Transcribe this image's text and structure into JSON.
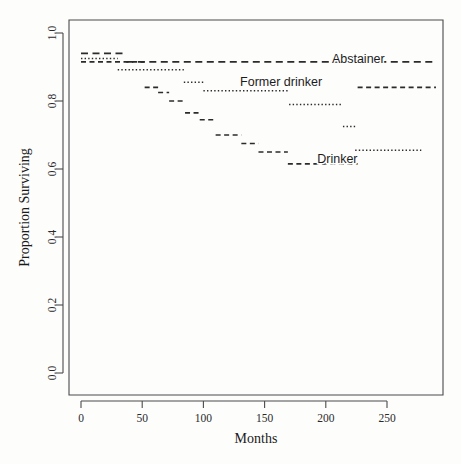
{
  "figure": {
    "background": "#fdfdfc",
    "ink": "#2b2b2b",
    "caption": ""
  },
  "chart_data": {
    "type": "line",
    "subtype": "kaplan-meier-step",
    "title": "",
    "xlabel": "Months",
    "ylabel": "Proportion Surviving",
    "xlim": [
      0,
      290
    ],
    "ylim": [
      0.0,
      1.0
    ],
    "grid": false,
    "legend_position": "inline-annotations",
    "xticks": [
      0,
      50,
      100,
      150,
      200,
      250
    ],
    "xticklabels": [
      "0",
      "50",
      "100",
      "150",
      "200",
      "250"
    ],
    "yticks": [
      0.0,
      0.2,
      0.4,
      0.6,
      0.8,
      1.0
    ],
    "yticklabels": [
      "0.0",
      "0.2",
      "0.4",
      "0.6",
      "0.8",
      "1.0"
    ],
    "series": [
      {
        "name": "Abstainer",
        "linestyle": "longdash",
        "label_x": 205,
        "label_y": 0.925,
        "steps": [
          [
            0,
            0.94
          ],
          [
            37,
            0.94
          ],
          [
            37,
            0.915
          ],
          [
            290,
            0.915
          ]
        ]
      },
      {
        "name": "Former drinker",
        "linestyle": "dotted",
        "label_x": 130,
        "label_y": 0.855,
        "steps": [
          [
            0,
            0.925
          ],
          [
            30,
            0.925
          ],
          [
            30,
            0.892
          ],
          [
            84,
            0.892
          ],
          [
            84,
            0.855
          ],
          [
            100,
            0.855
          ],
          [
            100,
            0.83
          ],
          [
            170,
            0.83
          ],
          [
            170,
            0.79
          ],
          [
            214,
            0.79
          ],
          [
            214,
            0.725
          ],
          [
            224,
            0.725
          ],
          [
            224,
            0.655
          ],
          [
            278,
            0.655
          ]
        ]
      },
      {
        "name": "Drinker",
        "linestyle": "dashed",
        "label_x": 193,
        "label_y": 0.63,
        "steps": [
          [
            0,
            0.915
          ],
          [
            52,
            0.915
          ],
          [
            52,
            0.84
          ],
          [
            63,
            0.84
          ],
          [
            63,
            0.825
          ],
          [
            72,
            0.825
          ],
          [
            72,
            0.8
          ],
          [
            85,
            0.8
          ],
          [
            85,
            0.765
          ],
          [
            97,
            0.765
          ],
          [
            97,
            0.745
          ],
          [
            110,
            0.745
          ],
          [
            110,
            0.7
          ],
          [
            131,
            0.7
          ],
          [
            131,
            0.675
          ],
          [
            145,
            0.675
          ],
          [
            145,
            0.65
          ],
          [
            169,
            0.65
          ],
          [
            169,
            0.615
          ],
          [
            226,
            0.615
          ],
          [
            226,
            0.84
          ],
          [
            290,
            0.84
          ]
        ]
      }
    ],
    "annotations": [
      {
        "text": "Abstainer",
        "x": 205,
        "y": 0.925
      },
      {
        "text": "Former drinker",
        "x": 130,
        "y": 0.855
      },
      {
        "text": "Drinker",
        "x": 193,
        "y": 0.63
      }
    ]
  }
}
